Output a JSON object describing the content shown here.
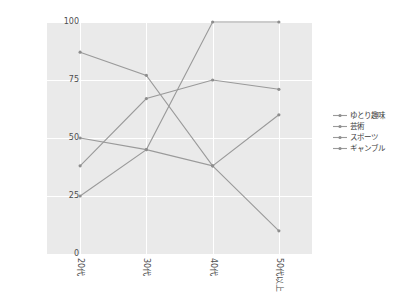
{
  "chart_data": {
    "type": "line",
    "title": "",
    "xlabel": "",
    "ylabel": "",
    "categories": [
      "20代",
      "30代",
      "40代",
      "50代以上"
    ],
    "ylim": [
      0,
      100
    ],
    "yticks": [
      0,
      25,
      50,
      75,
      100
    ],
    "grid": true,
    "legend_position": "right",
    "series": [
      {
        "name": "ゆとり趣味",
        "values": [
          25,
          45,
          100,
          100
        ]
      },
      {
        "name": "芸術",
        "values": [
          38,
          67,
          75,
          71
        ]
      },
      {
        "name": "スポーツ",
        "values": [
          50,
          45,
          38,
          60
        ]
      },
      {
        "name": "ギャンブル",
        "values": [
          87,
          77,
          38,
          10
        ]
      }
    ],
    "line_color": "#9a9a9a",
    "marker_color": "#8e8e8e",
    "plot_background": "#eaeaea",
    "figure_background": "#ffffff"
  },
  "axis": {
    "ytick_labels": [
      "0",
      "25",
      "50",
      "75",
      "100"
    ],
    "xtick_labels": [
      "20代",
      "30代",
      "40代",
      "50代以上"
    ]
  },
  "legend": {
    "entries": [
      {
        "label": "ゆとり趣味"
      },
      {
        "label": "芸術"
      },
      {
        "label": "スポーツ"
      },
      {
        "label": "ギャンブル"
      }
    ]
  }
}
